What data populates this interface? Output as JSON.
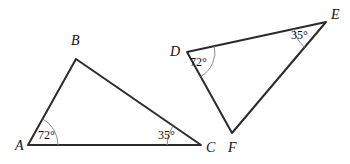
{
  "figure": {
    "background_color": "#ffffff",
    "edge_color": "#2b2b2b",
    "arc_color": "#8a8a8a",
    "label_color": "#111111",
    "degree_symbol": "°",
    "triangles": [
      {
        "name": "triangle-abc",
        "vertices": [
          {
            "label": "A",
            "x": 28,
            "y": 145,
            "label_x": 15,
            "label_y": 150
          },
          {
            "label": "B",
            "x": 76,
            "y": 59,
            "label_x": 71,
            "label_y": 45
          },
          {
            "label": "C",
            "x": 201,
            "y": 145,
            "label_x": 206,
            "label_y": 152
          }
        ],
        "angles": [
          {
            "at": "A",
            "value": "72°",
            "label_x": 38,
            "label_y": 139,
            "radius": 30
          },
          {
            "at": "C",
            "value": "35°",
            "label_x": 158,
            "label_y": 139,
            "radius": 34
          }
        ]
      },
      {
        "name": "triangle-def",
        "vertices": [
          {
            "label": "D",
            "x": 187,
            "y": 52,
            "label_x": 170,
            "label_y": 56
          },
          {
            "label": "E",
            "x": 326,
            "y": 22,
            "label_x": 331,
            "label_y": 19
          },
          {
            "label": "F",
            "x": 232,
            "y": 133,
            "label_x": 228,
            "label_y": 152
          }
        ],
        "angles": [
          {
            "at": "D",
            "value": "72°",
            "label_x": 190,
            "label_y": 66,
            "radius": 28
          },
          {
            "at": "E",
            "value": "35°",
            "label_x": 291,
            "label_y": 39,
            "radius": 33
          }
        ]
      }
    ]
  }
}
